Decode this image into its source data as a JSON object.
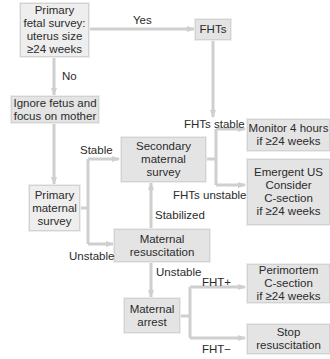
{
  "diagram": {
    "colors": {
      "box_fill": "#e4e4e4",
      "box_border": "#d2d2d2",
      "line": "#cfcfcf",
      "text": "#2b2b2b"
    },
    "nodes": {
      "primary_fetal_survey": "Primary\nfetal survey:\nuterus size\n≥24 weeks",
      "fhts": "FHTs",
      "ignore_fetus": "Ignore fetus and\nfocus on mother",
      "primary_maternal_survey": "Primary\nmaternal\nsurvey",
      "secondary_maternal_survey": "Secondary\nmaternal\nsurvey",
      "monitor": "Monitor 4 hours\nif ≥24 weeks",
      "emergent_us": "Emergent US\nConsider\nC-section\nif ≥24 weeks",
      "maternal_resuscitation": "Maternal\nresuscitation",
      "maternal_arrest": "Maternal\narrest",
      "perimortem": "Perimortem\nC-section\nif ≥24 weeks",
      "stop_resuscitation": "Stop\nresuscitation"
    },
    "edge_labels": {
      "yes": "Yes",
      "no": "No",
      "stable": "Stable",
      "unstable_left": "Unstable",
      "fhts_stable": "FHTs stable",
      "fhts_unstable": "FHTs unstable",
      "stabilized": "Stabilized",
      "unstable_down": "Unstable",
      "fht_plus": "FHT+",
      "fht_minus": "FHT−"
    }
  }
}
